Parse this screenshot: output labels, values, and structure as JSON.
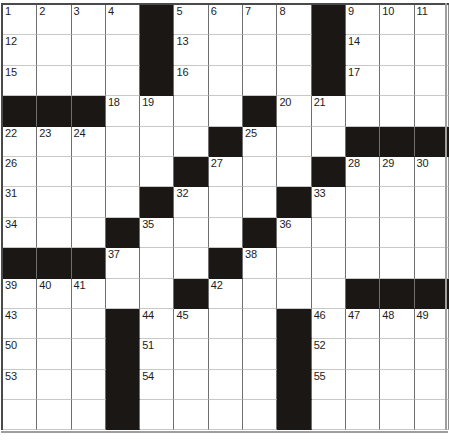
{
  "puzzle": {
    "title": "Crossword Grid",
    "columns": 13,
    "rows": 14,
    "colors": {
      "block": "#1a1714",
      "cell": "#ffffff",
      "grid_line": "#8f8f8f",
      "number_text": "#1c1c1c",
      "border": "#4a4a4a"
    },
    "grid": [
      [
        "1",
        "2",
        "3",
        "4",
        "#",
        "5",
        "6",
        "7",
        "8",
        "#",
        "9",
        "10",
        "11"
      ],
      [
        "12",
        "",
        "",
        "",
        "#",
        "13",
        "",
        "",
        "",
        "#",
        "14",
        "",
        ""
      ],
      [
        "15",
        "",
        "",
        "",
        "#",
        "16",
        "",
        "",
        "",
        "#",
        "17",
        "",
        ""
      ],
      [
        "#",
        "#",
        "#",
        "18",
        "19",
        "",
        "",
        "#",
        "20",
        "21",
        "",
        "",
        ""
      ],
      [
        "22",
        "23",
        "24",
        "",
        "",
        "",
        "#",
        "25",
        "",
        "",
        "#",
        "#",
        "#"
      ],
      [
        "26",
        "",
        "",
        "",
        "",
        "#",
        "27",
        "",
        "",
        "#",
        "28",
        "29",
        "30"
      ],
      [
        "31",
        "",
        "",
        "",
        "#",
        "32",
        "",
        "",
        "#",
        "33",
        "",
        "",
        ""
      ],
      [
        "34",
        "",
        "",
        "#",
        "35",
        "",
        "",
        "#",
        "36",
        "",
        "",
        "",
        ""
      ],
      [
        "#",
        "#",
        "#",
        "37",
        "",
        "",
        "#",
        "38",
        "",
        "",
        "",
        "",
        ""
      ],
      [
        "39",
        "40",
        "41",
        "",
        "",
        "#",
        "42",
        "",
        "",
        "",
        "#",
        "#",
        "#"
      ],
      [
        "43",
        "",
        "",
        "#",
        "44",
        "45",
        "",
        "",
        "#",
        "46",
        "47",
        "48",
        "49"
      ],
      [
        "50",
        "",
        "",
        "#",
        "51",
        "",
        "",
        "",
        "#",
        "52",
        "",
        "",
        ""
      ],
      [
        "53",
        "",
        "",
        "#",
        "54",
        "",
        "",
        "",
        "#",
        "55",
        "",
        "",
        ""
      ],
      [
        "",
        "",
        "",
        "#",
        "",
        "",
        "",
        "",
        "#",
        "",
        "",
        "",
        ""
      ]
    ],
    "numbers_across": [
      "1",
      "5",
      "9",
      "12",
      "13",
      "14",
      "15",
      "16",
      "17",
      "18",
      "20",
      "22",
      "25",
      "26",
      "27",
      "28",
      "31",
      "32",
      "33",
      "34",
      "35",
      "36",
      "37",
      "38",
      "39",
      "42",
      "43",
      "44",
      "46",
      "50",
      "51",
      "52",
      "53",
      "54",
      "55"
    ],
    "numbers_down": [
      "1",
      "2",
      "3",
      "4",
      "5",
      "6",
      "7",
      "8",
      "9",
      "10",
      "11",
      "19",
      "21",
      "23",
      "24",
      "29",
      "30",
      "40",
      "41",
      "45",
      "47",
      "48",
      "49"
    ],
    "max_number": "55"
  }
}
